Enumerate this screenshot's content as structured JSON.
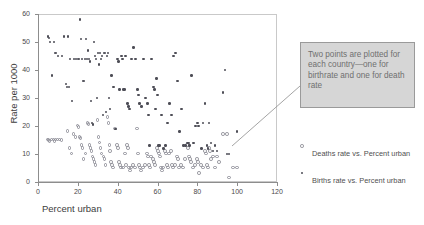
{
  "chart_data": {
    "type": "scatter",
    "title": "",
    "xlabel": "Percent urban",
    "ylabel": "Rate per 1000",
    "xlim": [
      0,
      120
    ],
    "ylim": [
      0,
      60
    ],
    "xticks": [
      0,
      20,
      40,
      60,
      80,
      100,
      120
    ],
    "yticks": [
      0,
      10,
      20,
      30,
      40,
      50,
      60
    ],
    "grid": false,
    "legend_position": "right",
    "annotation": "Two points are plotted for each country—one for birthrate and one for death rate",
    "annotation_target": [
      95,
      17
    ],
    "series": [
      {
        "name": "Deaths rate vs. Percent urban",
        "marker": "open-circle",
        "color": "#8f8f98",
        "points": [
          [
            5,
            15
          ],
          [
            5.5,
            14.8
          ],
          [
            6,
            14.6
          ],
          [
            7,
            15
          ],
          [
            8,
            15
          ],
          [
            8.5,
            14.6
          ],
          [
            9,
            15
          ],
          [
            10,
            15
          ],
          [
            11,
            15
          ],
          [
            12,
            14.8
          ],
          [
            15,
            18
          ],
          [
            16,
            12
          ],
          [
            17,
            10
          ],
          [
            18,
            17
          ],
          [
            19,
            16
          ],
          [
            20,
            20
          ],
          [
            20.5,
            19.5
          ],
          [
            21,
            16
          ],
          [
            21.5,
            15.5
          ],
          [
            22,
            13
          ],
          [
            22.5,
            12
          ],
          [
            23,
            8
          ],
          [
            24,
            10
          ],
          [
            25,
            21
          ],
          [
            25.5,
            20.5
          ],
          [
            26,
            13
          ],
          [
            26.5,
            12
          ],
          [
            27,
            11
          ],
          [
            27.5,
            9
          ],
          [
            28,
            8
          ],
          [
            28.5,
            7
          ],
          [
            29,
            6
          ],
          [
            30,
            22
          ],
          [
            30.5,
            16
          ],
          [
            31,
            14
          ],
          [
            31.5,
            12
          ],
          [
            32,
            10
          ],
          [
            33,
            9
          ],
          [
            33.5,
            8
          ],
          [
            34,
            6
          ],
          [
            35,
            23
          ],
          [
            35.5,
            21
          ],
          [
            36,
            13
          ],
          [
            36.5,
            11
          ],
          [
            37,
            7
          ],
          [
            37.5,
            6
          ],
          [
            38,
            5
          ],
          [
            39,
            19
          ],
          [
            40,
            13
          ],
          [
            40.5,
            12
          ],
          [
            41,
            7
          ],
          [
            41.5,
            6
          ],
          [
            42,
            5
          ],
          [
            43,
            5
          ],
          [
            44,
            10
          ],
          [
            44.5,
            6
          ],
          [
            45,
            13
          ],
          [
            45.5,
            12
          ],
          [
            46,
            5
          ],
          [
            46.5,
            4
          ],
          [
            47,
            5
          ],
          [
            48,
            6
          ],
          [
            49,
            5
          ],
          [
            50,
            19
          ],
          [
            50.5,
            10
          ],
          [
            51,
            6
          ],
          [
            51.5,
            5
          ],
          [
            52,
            4
          ],
          [
            53,
            5
          ],
          [
            54,
            6
          ],
          [
            55,
            10
          ],
          [
            55.5,
            9
          ],
          [
            56,
            6
          ],
          [
            56.5,
            5
          ],
          [
            57,
            9
          ],
          [
            58,
            8
          ],
          [
            58.5,
            7
          ],
          [
            59,
            6
          ],
          [
            60,
            12
          ],
          [
            60.5,
            11
          ],
          [
            61,
            10
          ],
          [
            61.5,
            9
          ],
          [
            62,
            5
          ],
          [
            62.5,
            4
          ],
          [
            63,
            5
          ],
          [
            64,
            11
          ],
          [
            64.5,
            10
          ],
          [
            65,
            6
          ],
          [
            65.5,
            5
          ],
          [
            66,
            10
          ],
          [
            67,
            11
          ],
          [
            67.5,
            6
          ],
          [
            68,
            5
          ],
          [
            69,
            6
          ],
          [
            70,
            9
          ],
          [
            70.5,
            8
          ],
          [
            71,
            5
          ],
          [
            72,
            6
          ],
          [
            73,
            5
          ],
          [
            74,
            8
          ],
          [
            75,
            13
          ],
          [
            75.5,
            12
          ],
          [
            76,
            9
          ],
          [
            76.5,
            8
          ],
          [
            77,
            7
          ],
          [
            78,
            5
          ],
          [
            79,
            6
          ],
          [
            80,
            8
          ],
          [
            80.5,
            7
          ],
          [
            81,
            3
          ],
          [
            82,
            6
          ],
          [
            83,
            5
          ],
          [
            84,
            11
          ],
          [
            84.5,
            10
          ],
          [
            85,
            6
          ],
          [
            85.5,
            5
          ],
          [
            86,
            12
          ],
          [
            86.5,
            11
          ],
          [
            87,
            8
          ],
          [
            88,
            9
          ],
          [
            89,
            5
          ],
          [
            90,
            9
          ],
          [
            91,
            7
          ],
          [
            93,
            17
          ],
          [
            95,
            17
          ],
          [
            96,
            1.5
          ],
          [
            98,
            5
          ],
          [
            100,
            5
          ]
        ]
      },
      {
        "name": "Births rate vs. Percent urban",
        "marker": "filled-dot",
        "color": "#4e4e57",
        "points": [
          [
            5,
            52
          ],
          [
            5.5,
            51.5
          ],
          [
            6,
            50
          ],
          [
            7,
            38
          ],
          [
            8,
            50
          ],
          [
            8.5,
            46
          ],
          [
            9,
            46
          ],
          [
            10,
            45
          ],
          [
            12,
            45
          ],
          [
            13,
            52
          ],
          [
            14,
            35
          ],
          [
            14.5,
            34
          ],
          [
            15,
            52
          ],
          [
            15.5,
            34
          ],
          [
            16,
            44
          ],
          [
            17,
            29
          ],
          [
            18,
            44
          ],
          [
            19,
            44
          ],
          [
            20,
            44
          ],
          [
            20.5,
            44
          ],
          [
            21,
            58
          ],
          [
            21.5,
            51
          ],
          [
            22,
            44
          ],
          [
            22.5,
            36
          ],
          [
            23,
            36
          ],
          [
            23.5,
            44
          ],
          [
            24,
            51
          ],
          [
            24.5,
            44
          ],
          [
            25,
            47
          ],
          [
            25.5,
            44
          ],
          [
            26,
            43
          ],
          [
            26.5,
            29
          ],
          [
            27,
            21
          ],
          [
            27.5,
            20.5
          ],
          [
            28,
            50
          ],
          [
            28.5,
            45
          ],
          [
            29,
            44
          ],
          [
            29.5,
            30
          ],
          [
            30,
            46
          ],
          [
            30.5,
            42
          ],
          [
            31,
            46
          ],
          [
            31.5,
            44
          ],
          [
            32,
            45
          ],
          [
            32.5,
            24
          ],
          [
            33,
            46
          ],
          [
            33.5,
            46
          ],
          [
            34,
            25
          ],
          [
            34.5,
            45
          ],
          [
            35,
            46
          ],
          [
            35.5,
            30
          ],
          [
            36,
            26
          ],
          [
            37,
            38
          ],
          [
            38,
            34
          ],
          [
            39,
            19
          ],
          [
            40,
            44
          ],
          [
            40.5,
            43
          ],
          [
            41,
            33
          ],
          [
            42,
            45
          ],
          [
            42.5,
            44
          ],
          [
            43,
            33
          ],
          [
            43.5,
            33
          ],
          [
            44,
            45
          ],
          [
            45,
            28
          ],
          [
            45.5,
            27
          ],
          [
            46,
            26
          ],
          [
            47,
            44
          ],
          [
            48,
            48
          ],
          [
            49,
            44
          ],
          [
            50,
            33
          ],
          [
            50.5,
            31
          ],
          [
            51,
            28
          ],
          [
            52,
            27
          ],
          [
            53,
            44
          ],
          [
            54,
            30
          ],
          [
            55,
            28
          ],
          [
            55.5,
            24
          ],
          [
            56,
            13
          ],
          [
            57,
            44
          ],
          [
            58,
            34
          ],
          [
            58.5,
            33
          ],
          [
            59,
            26
          ],
          [
            59.5,
            37
          ],
          [
            60,
            31
          ],
          [
            60.5,
            13
          ],
          [
            61,
            13
          ],
          [
            62,
            24
          ],
          [
            63,
            12
          ],
          [
            64,
            13
          ],
          [
            65,
            21
          ],
          [
            66,
            28
          ],
          [
            67,
            24
          ],
          [
            68,
            45
          ],
          [
            69,
            46
          ],
          [
            70,
            36
          ],
          [
            71,
            18
          ],
          [
            72,
            26
          ],
          [
            73,
            13
          ],
          [
            74,
            13
          ],
          [
            75,
            14
          ],
          [
            75.5,
            14
          ],
          [
            76,
            13
          ],
          [
            77,
            38
          ],
          [
            78,
            14
          ],
          [
            79,
            20
          ],
          [
            80,
            21
          ],
          [
            80.5,
            20
          ],
          [
            82,
            12
          ],
          [
            83,
            21
          ],
          [
            84,
            28
          ],
          [
            85,
            13
          ],
          [
            85.5,
            12
          ],
          [
            86,
            21
          ],
          [
            87,
            14
          ],
          [
            88,
            11
          ],
          [
            89,
            13
          ],
          [
            90,
            11
          ],
          [
            93,
            32
          ],
          [
            94,
            40
          ],
          [
            95,
            10
          ],
          [
            96,
            10
          ],
          [
            100,
            18
          ]
        ]
      }
    ]
  },
  "axes": {
    "ylabel": "Rate per 1000",
    "xlabel": "Percent urban",
    "yticks": [
      "0",
      "10",
      "20",
      "30",
      "40",
      "50",
      "60"
    ],
    "xticks": [
      "0",
      "20",
      "40",
      "60",
      "80",
      "100",
      "120"
    ]
  },
  "callout": {
    "text": "Two points are plotted for each country—one for birthrate and one for death rate"
  },
  "legend": {
    "items": [
      {
        "label": "Deaths rate vs. Percent urban",
        "marker": "open-circle"
      },
      {
        "label": "Births rate vs. Percent urban",
        "marker": "filled-dot"
      }
    ]
  }
}
